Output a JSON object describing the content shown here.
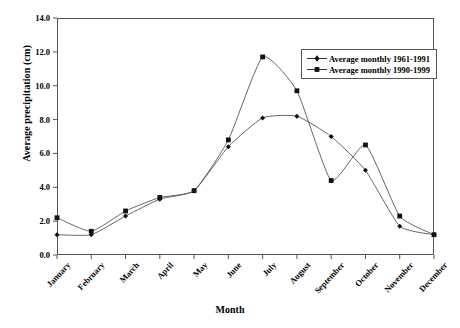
{
  "chart_data": {
    "type": "line",
    "title": "",
    "xlabel": "Month",
    "ylabel": "Average precipitation (cm)",
    "categories": [
      "January",
      "February",
      "March",
      "April",
      "May",
      "June",
      "July",
      "August",
      "September",
      "October",
      "November",
      "December"
    ],
    "series": [
      {
        "name": "Average monthly 1961-1991",
        "marker": "diamond",
        "values": [
          1.2,
          1.2,
          2.3,
          3.3,
          3.8,
          6.4,
          8.1,
          8.2,
          7.0,
          5.0,
          1.7,
          1.2
        ]
      },
      {
        "name": "Average monthly 1990-1999",
        "marker": "square",
        "values": [
          2.2,
          1.4,
          2.6,
          3.4,
          3.8,
          6.8,
          11.7,
          9.7,
          4.4,
          6.5,
          2.3,
          1.2
        ]
      }
    ],
    "ylim": [
      0.0,
      14.0
    ],
    "ytick_step": 2.0,
    "yticks": [
      "0.0",
      "2.0",
      "4.0",
      "6.0",
      "8.0",
      "10.0",
      "12.0",
      "14.0"
    ],
    "grid": false,
    "legend_position": "top-right",
    "line_color": "#555555",
    "marker_color": "#111111"
  },
  "legend": {
    "entries": [
      {
        "label": "Average monthly 1961-1991"
      },
      {
        "label": "Average monthly 1990-1999"
      }
    ]
  }
}
